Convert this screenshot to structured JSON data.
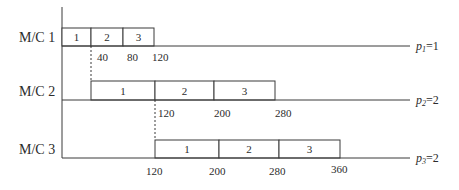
{
  "diagram": {
    "title": "",
    "axis": {
      "x": 62,
      "y_top": 7,
      "y_bottom": 158
    },
    "machines": [
      {
        "label": "M/C 1",
        "label_x": 19,
        "label_y": 42,
        "box_top": 28,
        "baseline": 46,
        "baseline_end": 410,
        "p_var": "p",
        "p_sub": "1",
        "p_rest": "=1",
        "p_x": 416,
        "p_y": 50,
        "jobs": [
          {
            "label": "1",
            "x0": 62,
            "x1": 91
          },
          {
            "label": "2",
            "x0": 91,
            "x1": 123
          },
          {
            "label": "3",
            "x0": 123,
            "x1": 154
          }
        ],
        "time_labels": [
          {
            "text": "40",
            "x": 97,
            "y": 61
          },
          {
            "text": "80",
            "x": 127,
            "y": 61
          },
          {
            "text": "120",
            "x": 152,
            "y": 61
          }
        ]
      },
      {
        "label": "M/C 2",
        "label_x": 19,
        "label_y": 96,
        "box_top": 81,
        "baseline": 100,
        "baseline_end": 410,
        "p_var": "p",
        "p_sub": "2",
        "p_rest": "=2",
        "p_x": 416,
        "p_y": 104,
        "jobs": [
          {
            "label": "1",
            "x0": 91,
            "x1": 155
          },
          {
            "label": "2",
            "x0": 155,
            "x1": 214
          },
          {
            "label": "3",
            "x0": 214,
            "x1": 275
          }
        ],
        "time_labels": [
          {
            "text": "120",
            "x": 158,
            "y": 117
          },
          {
            "text": "200",
            "x": 214,
            "y": 117
          },
          {
            "text": "280",
            "x": 275,
            "y": 117
          }
        ]
      },
      {
        "label": "M/C 3",
        "label_x": 19,
        "label_y": 154,
        "box_top": 140,
        "baseline": 158,
        "baseline_end": 410,
        "p_var": "p",
        "p_sub": "3",
        "p_rest": "=2",
        "p_x": 416,
        "p_y": 162,
        "jobs": [
          {
            "label": "1",
            "x0": 155,
            "x1": 219
          },
          {
            "label": "2",
            "x0": 219,
            "x1": 279
          },
          {
            "label": "3",
            "x0": 279,
            "x1": 340
          }
        ],
        "time_labels": [
          {
            "text": "120",
            "x": 146,
            "y": 175
          },
          {
            "text": "200",
            "x": 209,
            "y": 175
          },
          {
            "text": "280",
            "x": 269,
            "y": 175
          },
          {
            "text": "360",
            "x": 331,
            "y": 173
          }
        ]
      }
    ],
    "dashed_links": [
      {
        "x": 91,
        "y0": 46,
        "y1": 81
      },
      {
        "x": 155,
        "y0": 100,
        "y1": 140
      }
    ]
  }
}
